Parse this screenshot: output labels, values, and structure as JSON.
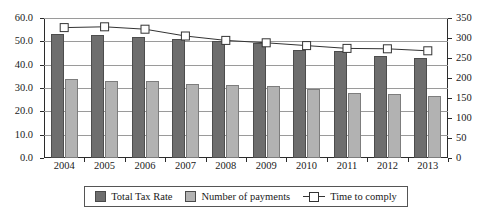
{
  "chart_data": {
    "type": "bar",
    "title": "",
    "subtitle": "",
    "xlabel": "",
    "ylabel": "",
    "categories": [
      "2004",
      "2005",
      "2006",
      "2007",
      "2008",
      "2009",
      "2010",
      "2011",
      "2012",
      "2013"
    ],
    "grid": true,
    "legend_position": "bottom",
    "axes": {
      "left": {
        "label": "",
        "ylim": [
          0.0,
          60.0
        ],
        "ticks": [
          "0.0",
          "10.0",
          "20.0",
          "30.0",
          "40.0",
          "50.0",
          "60.0"
        ],
        "tick_values": [
          0.0,
          10.0,
          20.0,
          30.0,
          40.0,
          50.0,
          60.0
        ]
      },
      "right": {
        "label": "",
        "ylim": [
          0,
          350
        ],
        "ticks": [
          "0",
          "50",
          "100",
          "150",
          "200",
          "250",
          "300",
          "350"
        ],
        "tick_values": [
          0,
          50,
          100,
          150,
          200,
          250,
          300,
          350
        ]
      }
    },
    "series": [
      {
        "name": "Total Tax Rate",
        "type": "bar",
        "axis": "left",
        "color": "#6e6e6e",
        "values": [
          53.3,
          52.9,
          51.9,
          51.2,
          50.2,
          49.4,
          46.2,
          46.0,
          43.9,
          42.7
        ]
      },
      {
        "name": "Number of payments",
        "type": "bar",
        "axis": "left",
        "color": "#b2b2b2",
        "values": [
          33.7,
          33.1,
          33.0,
          31.7,
          31.1,
          30.8,
          29.5,
          27.8,
          27.5,
          26.4
        ]
      },
      {
        "name": "Time to comply",
        "type": "line",
        "axis": "right",
        "color": "#333333",
        "marker": "square-open",
        "values": [
          326,
          328,
          322,
          305,
          294,
          288,
          281,
          274,
          273,
          268
        ]
      }
    ]
  },
  "legend": {
    "items": [
      {
        "label": "Total Tax Rate",
        "marker": "dark-swatch"
      },
      {
        "label": "Number of payments",
        "marker": "light-swatch"
      },
      {
        "label": "Time to comply",
        "marker": "line-square-marker"
      }
    ]
  }
}
